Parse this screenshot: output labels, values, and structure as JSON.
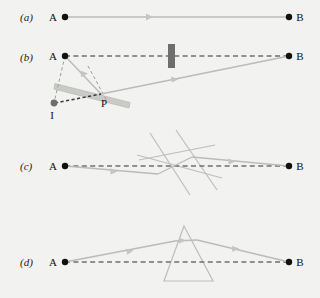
{
  "figure": {
    "width": 320,
    "height": 298,
    "background": "#f2f2f0"
  },
  "colors": {
    "ray": "#b9bcb8",
    "ray_dark": "#a8aba7",
    "dashed_path": "#6f6f6f",
    "construction_dash": "#9aa09c",
    "point_fill": "#111111",
    "image_point_fill": "#6e6e6e",
    "mirror_fill": "#c9cbc6",
    "mirror_stroke": "#b0b3ae",
    "barrier_fill": "#6e6e6e",
    "prism_stroke": "#b9bcb8",
    "text": "#111111"
  },
  "panels": [
    {
      "id": "a",
      "label": "(a)",
      "label_x": 20,
      "label_y": 21,
      "points": [
        {
          "name": "A",
          "label": "A",
          "label_x": 53,
          "label_y": 21,
          "cx": 65,
          "cy": 17,
          "r": 3.2,
          "kind": "source"
        },
        {
          "name": "B",
          "label": "B",
          "label_x": 299,
          "label_y": 21,
          "cx": 289,
          "cy": 17,
          "r": 3.2,
          "kind": "target"
        }
      ],
      "rays": [
        {
          "name": "direct-ray",
          "x1": 65,
          "y1": 17,
          "x2": 289,
          "y2": 17,
          "style": "solid",
          "arrow_t": 0.5
        }
      ],
      "objects": []
    },
    {
      "id": "b",
      "label": "(b)",
      "label_x": 20,
      "label_y": 61,
      "points": [
        {
          "name": "A",
          "label": "A",
          "label_x": 53,
          "label_y": 60,
          "cx": 65,
          "cy": 56,
          "r": 3.2,
          "kind": "source"
        },
        {
          "name": "B",
          "label": "B",
          "label_x": 299,
          "label_y": 60,
          "cx": 289,
          "cy": 56,
          "r": 3.2,
          "kind": "target"
        },
        {
          "name": "P",
          "label": "P",
          "label_x": 104,
          "label_y": 107,
          "cx": 101,
          "cy": 94,
          "r": 0,
          "kind": "reflection-point"
        },
        {
          "name": "I",
          "label": "I",
          "label_x": 51,
          "label_y": 119,
          "cx": 54,
          "cy": 103,
          "r": 3.4,
          "kind": "image-point"
        }
      ],
      "rays": [
        {
          "name": "incident-ray",
          "x1": 65,
          "y1": 56,
          "x2": 101,
          "y2": 94,
          "style": "solid",
          "arrow_t": 0.55
        },
        {
          "name": "reflected-ray",
          "x1": 101,
          "y1": 94,
          "x2": 289,
          "y2": 56,
          "style": "solid",
          "arrow_t": 0.62
        },
        {
          "name": "blocked-direct-path",
          "x1": 65,
          "y1": 56,
          "x2": 289,
          "y2": 56,
          "style": "dashed",
          "arrow_t": null
        },
        {
          "name": "virtual-image-path",
          "x1": 54,
          "y1": 103,
          "x2": 101,
          "y2": 94,
          "style": "dotted-thick",
          "arrow_t": null
        },
        {
          "name": "construction-A-to-I",
          "x1": 65,
          "y1": 56,
          "x2": 54,
          "y2": 103,
          "style": "construction",
          "arrow_t": null
        },
        {
          "name": "normal-at-P",
          "x1": 89,
          "y1": 68,
          "x2": 106,
          "y2": 100,
          "style": "construction",
          "arrow_t": null
        }
      ],
      "objects": [
        {
          "name": "barrier",
          "type": "rect",
          "x": 168,
          "y": 44,
          "w": 7,
          "h": 24
        },
        {
          "name": "mirror-surface",
          "type": "bar",
          "x1": 56,
          "y1": 85,
          "x2": 130,
          "y2": 104,
          "thickness": 6
        }
      ]
    },
    {
      "id": "c",
      "label": "(c)",
      "label_x": 20,
      "label_y": 170,
      "points": [
        {
          "name": "A",
          "label": "A",
          "label_x": 53,
          "label_y": 170,
          "cx": 65,
          "cy": 166,
          "r": 3.2,
          "kind": "source"
        },
        {
          "name": "B",
          "label": "B",
          "label_x": 299,
          "label_y": 170,
          "cx": 289,
          "cy": 166,
          "r": 3.2,
          "kind": "target"
        }
      ],
      "rays": [
        {
          "name": "incident-ray-c",
          "x1": 65,
          "y1": 166,
          "x2": 158,
          "y2": 174,
          "style": "solid",
          "arrow_t": 0.55
        },
        {
          "name": "refracted-ray-c",
          "x1": 158,
          "y1": 174,
          "x2": 192,
          "y2": 157,
          "style": "solid",
          "arrow_t": null
        },
        {
          "name": "exit-ray-c",
          "x1": 192,
          "y1": 157,
          "x2": 289,
          "y2": 166,
          "style": "solid",
          "arrow_t": 0.45
        },
        {
          "name": "direct-path-c",
          "x1": 65,
          "y1": 166,
          "x2": 289,
          "y2": 166,
          "style": "dashed",
          "arrow_t": null
        }
      ],
      "objects": [
        {
          "name": "plate-face-left",
          "type": "line",
          "x1": 150,
          "y1": 133,
          "x2": 190,
          "y2": 195
        },
        {
          "name": "plate-face-right",
          "type": "line",
          "x1": 175,
          "y1": 130,
          "x2": 217,
          "y2": 189
        },
        {
          "name": "plate-edge-lower",
          "type": "line",
          "x1": 137,
          "y1": 155,
          "x2": 222,
          "y2": 177
        },
        {
          "name": "plate-edge-upper",
          "type": "line",
          "x1": 139,
          "y1": 160,
          "x2": 214,
          "y2": 145
        }
      ]
    },
    {
      "id": "d",
      "label": "(d)",
      "label_x": 20,
      "label_y": 266,
      "points": [
        {
          "name": "A",
          "label": "A",
          "label_x": 53,
          "label_y": 266,
          "cx": 65,
          "cy": 262,
          "r": 3.2,
          "kind": "source"
        },
        {
          "name": "B",
          "label": "B",
          "label_x": 299,
          "label_y": 266,
          "cx": 289,
          "cy": 262,
          "r": 3.2,
          "kind": "target"
        }
      ],
      "rays": [
        {
          "name": "incident-ray-d",
          "x1": 65,
          "y1": 262,
          "x2": 175,
          "y2": 241,
          "style": "solid",
          "arrow_t": 0.5
        },
        {
          "name": "inside-prism-ray-d",
          "x1": 175,
          "y1": 241,
          "x2": 196,
          "y2": 240,
          "style": "solid",
          "arrow_t": null
        },
        {
          "name": "exit-ray-d",
          "x1": 196,
          "y1": 240,
          "x2": 289,
          "y2": 262,
          "style": "solid",
          "arrow_t": 0.55
        },
        {
          "name": "direct-path-d",
          "x1": 65,
          "y1": 262,
          "x2": 289,
          "y2": 262,
          "style": "dashed",
          "arrow_t": null
        }
      ],
      "objects": [
        {
          "name": "prism",
          "type": "triangle",
          "apex_x": 184,
          "apex_y": 226,
          "left_x": 164,
          "left_y": 281,
          "right_x": 213,
          "right_y": 281
        }
      ]
    }
  ]
}
